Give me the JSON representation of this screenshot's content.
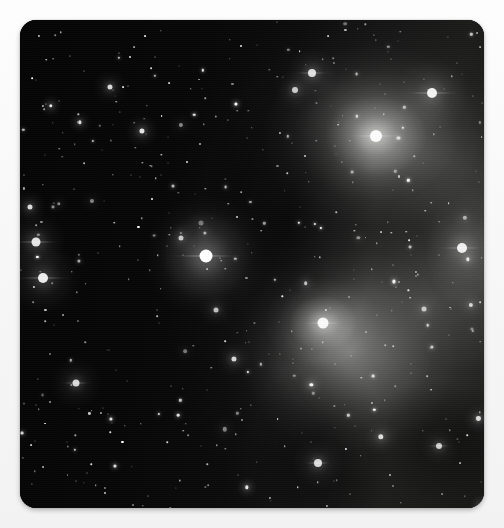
{
  "page": {
    "background_color": "#fafafa",
    "width": 504,
    "height": 528,
    "caption": ""
  },
  "photo": {
    "name": "star-cluster-photograph",
    "alt_text": "Grayscale astronomical photograph of an open star cluster surrounded by reflection nebulosity",
    "frame": {
      "left": 20,
      "top": 20,
      "width": 464,
      "height": 488,
      "corner_radius": 16,
      "border_color": "#050505",
      "shadow_color": "#00000047"
    },
    "palette": {
      "sky_dark": "#060607",
      "sky_mid": "#121212",
      "sky_light": "#1a1a19",
      "nebula_bright": "#ebebe6",
      "nebula_mid": "#a8a8a4",
      "nebula_dim": "#4d4d4c",
      "star_white": "#ffffff",
      "dust_lane": "#000000"
    }
  },
  "chart_data": {
    "type": "scatter",
    "xlabel": "",
    "ylabel": "",
    "xlim": [
      0,
      464
    ],
    "ylim": [
      0,
      488
    ],
    "grid": false,
    "legend": "none",
    "nebula_regions": [
      {
        "name": "upper-right-knot",
        "cx": 356,
        "cy": 116,
        "rx": 150,
        "ry": 120,
        "peak_brightness": 0.72
      },
      {
        "name": "lower-right-bubble",
        "cx": 330,
        "cy": 332,
        "rx": 135,
        "ry": 128,
        "peak_brightness": 0.5
      },
      {
        "name": "lower-nebula-core",
        "cx": 303,
        "cy": 303,
        "rx": 58,
        "ry": 46,
        "peak_brightness": 0.62
      },
      {
        "name": "right-edge-glow",
        "cx": 448,
        "cy": 228,
        "rx": 120,
        "ry": 180,
        "peak_brightness": 0.34
      },
      {
        "name": "broad-right-wash",
        "cx": 372,
        "cy": 250,
        "rx": 230,
        "ry": 300,
        "peak_brightness": 0.22
      },
      {
        "name": "center-star-halo",
        "cx": 186,
        "cy": 236,
        "rx": 62,
        "ry": 62,
        "peak_brightness": 0.3
      }
    ],
    "dust_lanes": [
      {
        "cx": 268,
        "cy": 200,
        "rx": 90,
        "ry": 150,
        "opacity": 0.62
      },
      {
        "cx": 300,
        "cy": 430,
        "rx": 70,
        "ry": 90,
        "opacity": 0.5
      },
      {
        "cx": 400,
        "cy": 210,
        "rx": 110,
        "ry": 70,
        "opacity": 0.4
      },
      {
        "cx": 420,
        "cy": 420,
        "rx": 80,
        "ry": 60,
        "opacity": 0.45
      }
    ],
    "bright_stars": [
      {
        "label": "central-bright-star",
        "x": 186,
        "y": 236,
        "size": 13,
        "glow": 46,
        "spikes": 78,
        "brightness": 1.0
      },
      {
        "label": "upper-right-nebular-star",
        "x": 356,
        "y": 116,
        "size": 12,
        "glow": 40,
        "spikes": 58,
        "brightness": 0.97
      },
      {
        "label": "upper-right-spiked-star",
        "x": 412,
        "y": 73,
        "size": 10,
        "glow": 30,
        "spikes": 62,
        "brightness": 0.94
      },
      {
        "label": "right-mid-star",
        "x": 442,
        "y": 228,
        "size": 10,
        "glow": 30,
        "spikes": 50,
        "brightness": 0.92
      },
      {
        "label": "lower-nebula-core-star",
        "x": 303,
        "y": 303,
        "size": 11,
        "glow": 34,
        "spikes": 44,
        "brightness": 0.95
      },
      {
        "label": "left-upper-star",
        "x": 16,
        "y": 222,
        "size": 9,
        "glow": 26,
        "spikes": 54,
        "brightness": 0.9
      },
      {
        "label": "left-lower-star",
        "x": 23,
        "y": 258,
        "size": 10,
        "glow": 30,
        "spikes": 60,
        "brightness": 0.93
      },
      {
        "label": "upper-pair-star-a",
        "x": 292,
        "y": 53,
        "size": 8,
        "glow": 22,
        "spikes": 40,
        "brightness": 0.86
      },
      {
        "label": "upper-pair-star-b",
        "x": 275,
        "y": 70,
        "size": 6,
        "glow": 16,
        "spikes": 0,
        "brightness": 0.78
      },
      {
        "label": "lower-left-bright",
        "x": 56,
        "y": 363,
        "size": 7,
        "glow": 20,
        "spikes": 34,
        "brightness": 0.84
      },
      {
        "label": "bottom-nebula-star",
        "x": 298,
        "y": 443,
        "size": 8,
        "glow": 22,
        "spikes": 30,
        "brightness": 0.85
      },
      {
        "label": "right-low-star",
        "x": 419,
        "y": 426,
        "size": 6,
        "glow": 16,
        "spikes": 26,
        "brightness": 0.8
      },
      {
        "label": "mid-field-star",
        "x": 196,
        "y": 290,
        "size": 5,
        "glow": 13,
        "spikes": 0,
        "brightness": 0.74
      },
      {
        "label": "nebula-edge-star",
        "x": 404,
        "y": 289,
        "size": 5,
        "glow": 13,
        "spikes": 0,
        "brightness": 0.72
      }
    ],
    "field_star_count": 470
  }
}
